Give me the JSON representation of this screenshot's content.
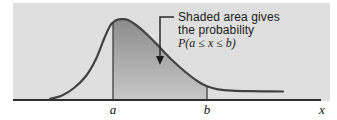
{
  "figure": {
    "annotation": {
      "line1": "Shaded area gives",
      "line2": "the probability",
      "line3": "P(a ≤ x ≤ b)"
    },
    "axis_labels": {
      "a": "a",
      "b": "b",
      "x": "x"
    },
    "colors": {
      "panel_bg": "#dfdfdf",
      "curve": "#424242",
      "axis": "#2f2f2f",
      "boundary_line": "#333333",
      "leader": "#2b2b2b",
      "arrow_fill": "#1b1b1b",
      "shade_top": "#8c8c8c",
      "shade_bottom": "#c8c8c8",
      "text": "#1b1b1b"
    }
  },
  "chart_data": {
    "type": "area",
    "title": "",
    "xlabel": "x",
    "ylabel": "",
    "x_axis_points": [
      "a",
      "b"
    ],
    "annotation_text": "Shaded area gives the probability P(a ≤ x ≤ b)",
    "shaded_interval": [
      "a",
      "b"
    ],
    "a_x": 113,
    "b_x": 207,
    "baseline_y": 100,
    "axis_x_range": [
      13,
      321
    ],
    "curve_points": [
      [
        50,
        99
      ],
      [
        62,
        95.5
      ],
      [
        74,
        88
      ],
      [
        86,
        76
      ],
      [
        96,
        59
      ],
      [
        104,
        39
      ],
      [
        110,
        26
      ],
      [
        113,
        22.5
      ],
      [
        117,
        19.8
      ],
      [
        122,
        19.2
      ],
      [
        128,
        20
      ],
      [
        136,
        25
      ],
      [
        146,
        33.5
      ],
      [
        158,
        45.5
      ],
      [
        172,
        60
      ],
      [
        186,
        72.5
      ],
      [
        198,
        81.5
      ],
      [
        207,
        86.3
      ],
      [
        218,
        89.3
      ],
      [
        232,
        90.6
      ],
      [
        252,
        91.2
      ],
      [
        270,
        91.4
      ],
      [
        283,
        91.5
      ]
    ]
  }
}
